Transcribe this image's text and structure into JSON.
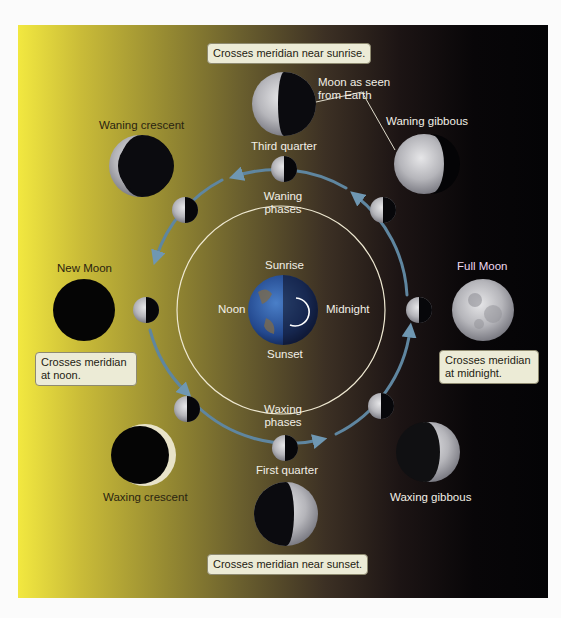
{
  "diagram": {
    "colors": {
      "sunlit_side": "#f2e840",
      "night_side": "#040406",
      "orbit_arrow": "#5f86a0",
      "inner_circle": "#f2efe6",
      "callout_bg": "#ecebd6"
    },
    "callouts": {
      "top": "Crosses meridian near sunrise.",
      "left": "Crosses meridian at noon.",
      "right": "Crosses meridian at midnight.",
      "bottom": "Crosses meridian near sunset."
    },
    "annotation": "Moon as seen from Earth",
    "phases": {
      "new_moon": "New Moon",
      "waxing_crescent": "Waxing crescent",
      "first_quarter": "First quarter",
      "waxing_gibbous": "Waxing gibbous",
      "full_moon": "Full Moon",
      "waning_gibbous": "Waning gibbous",
      "third_quarter": "Third quarter",
      "waning_crescent": "Waning crescent"
    },
    "phase_groups": {
      "waning": "Waning phases",
      "waxing": "Waxing phases"
    },
    "earth_times": {
      "top": "Sunrise",
      "left": "Noon",
      "right": "Midnight",
      "bottom": "Sunset"
    }
  }
}
